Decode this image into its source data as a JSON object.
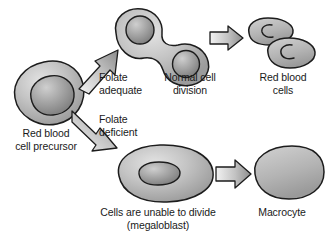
{
  "figure": {
    "background_color": "#ffffff",
    "text_color": "#1a1a1a",
    "cell_fill_light": "#d8d8d8",
    "cell_fill_mid": "#b5b5b5",
    "cell_fill_dark": "#8f8f8f",
    "outline_color": "#1c1c1c",
    "arrow_fill": "#9a9a9a"
  },
  "labels": {
    "precursor": "Red blood\ncell precursor",
    "folate_adequate": "Folate\nadequate",
    "folate_deficient": "Folate\ndeficient",
    "normal_division": "Normal cell\ndivision",
    "red_blood_cells": "Red blood\ncells",
    "megaloblast": "Cells are unable to divide\n(megaloblast)",
    "macrocyte": "Macrocyte"
  },
  "diagram_data": {
    "type": "flow",
    "nodes": [
      {
        "id": "precursor",
        "name": "Red blood cell precursor",
        "shape": "round-cell-with-nucleus",
        "nuclei": 1
      },
      {
        "id": "dividing",
        "name": "Normal cell division",
        "shape": "dumbbell-cell",
        "nuclei": 2
      },
      {
        "id": "rbcs",
        "name": "Red blood cells",
        "shape": "biconcave-discs",
        "count": 2,
        "nuclei": 0
      },
      {
        "id": "megaloblast",
        "name": "Cells are unable to divide (megaloblast)",
        "shape": "large-oval-cell-with-nucleus",
        "nuclei": 1
      },
      {
        "id": "macrocyte",
        "name": "Macrocyte",
        "shape": "large-oval-disc",
        "nuclei": 0
      }
    ],
    "edges": [
      {
        "from": "precursor",
        "to": "dividing",
        "label": "Folate adequate",
        "style": "block-arrow-up-right"
      },
      {
        "from": "precursor",
        "to": "megaloblast",
        "label": "Folate deficient",
        "style": "block-arrow-down-right"
      },
      {
        "from": "dividing",
        "to": "rbcs",
        "label": "",
        "style": "block-arrow-right"
      },
      {
        "from": "megaloblast",
        "to": "macrocyte",
        "label": "",
        "style": "block-arrow-right"
      }
    ]
  }
}
